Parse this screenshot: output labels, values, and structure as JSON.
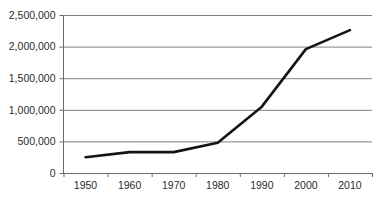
{
  "chart_data": {
    "type": "line",
    "title": "",
    "subtitle": "",
    "xlabel": "",
    "ylabel": "",
    "categories": [
      "1950",
      "1960",
      "1970",
      "1980",
      "1990",
      "2000",
      "2010"
    ],
    "x": [
      1950,
      1960,
      1970,
      1980,
      1990,
      2000,
      2010
    ],
    "values": [
      250000,
      330000,
      330000,
      480000,
      1050000,
      1960000,
      2260000
    ],
    "series": [
      {
        "name": "",
        "values": [
          250000,
          330000,
          330000,
          480000,
          1050000,
          1960000,
          2260000
        ]
      }
    ],
    "ylim": [
      0,
      2500000
    ],
    "y_ticks": [
      0,
      500000,
      1000000,
      1500000,
      2000000,
      2500000
    ],
    "y_tick_labels": [
      "0",
      "500,000",
      "1,000,000",
      "1,500,000",
      "2,000,000",
      "2,500,000"
    ],
    "x_tick_labels": [
      "1950",
      "1960",
      "1970",
      "1980",
      "1990",
      "2000",
      "2010"
    ],
    "grid": "horizontal",
    "legend": "none",
    "annotations": [],
    "colors": {
      "background": "#ffffff",
      "gridline": "#808080",
      "axis": "#6b6b6b",
      "series_line": "#141414",
      "tick_label": "#2b2b2b"
    }
  }
}
